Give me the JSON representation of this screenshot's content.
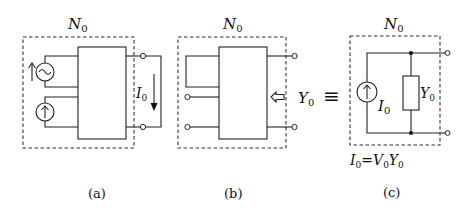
{
  "figure": {
    "panels": [
      {
        "id": "a",
        "caption": "(a)",
        "network_label": "N",
        "network_sub": "0",
        "current_label": "I",
        "current_sub": "0",
        "sources": [
          "ac-voltage-source",
          "dc-current-source"
        ]
      },
      {
        "id": "b",
        "caption": "(b)",
        "network_label": "N",
        "network_sub": "0",
        "admittance_label": "Y",
        "admittance_sub": "0"
      },
      {
        "id": "c",
        "caption": "(c)",
        "network_label": "N",
        "network_sub": "0",
        "source_label": "I",
        "source_sub": "0",
        "admittance_label": "Y",
        "admittance_sub": "0",
        "equation": {
          "lhs": "I",
          "lhs_sub": "0",
          "eq": "=",
          "v": "V",
          "v_sub": "0",
          "y": "Y",
          "y_sub": "0"
        }
      }
    ],
    "equivalence_symbol": "≡"
  }
}
